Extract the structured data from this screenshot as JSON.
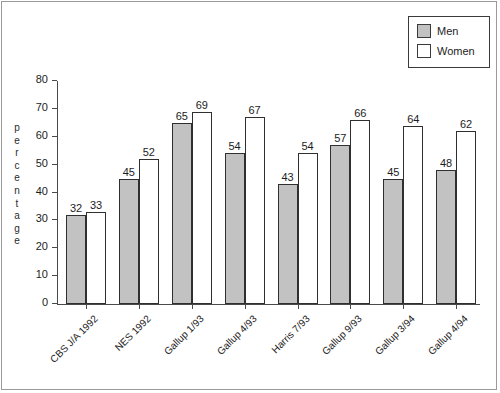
{
  "chart_data": {
    "type": "bar",
    "title": "",
    "subtitle": "",
    "xlabel": "",
    "ylabel": "percentage",
    "ylim": [
      0,
      80
    ],
    "ytick_step": 10,
    "yticks": [
      0,
      10,
      20,
      30,
      40,
      50,
      60,
      70,
      80
    ],
    "grid": false,
    "legend_position": "top-right",
    "categories": [
      "CBS J/A 1992",
      "NES 1992",
      "Gallup 1/93",
      "Gallup 4/93",
      "Harris 7/93",
      "Gallup 9/93",
      "Gallup 3/94",
      "Gallup 4/94"
    ],
    "series": [
      {
        "name": "Men",
        "color": "#c2c2c2",
        "values": [
          32,
          45,
          65,
          54,
          43,
          57,
          45,
          48
        ]
      },
      {
        "name": "Women",
        "color": "#ffffff",
        "values": [
          33,
          52,
          69,
          67,
          54,
          66,
          64,
          62
        ]
      }
    ]
  },
  "legend": {
    "items": [
      {
        "label": "Men",
        "color": "#c2c2c2"
      },
      {
        "label": "Women",
        "color": "#ffffff"
      }
    ]
  }
}
